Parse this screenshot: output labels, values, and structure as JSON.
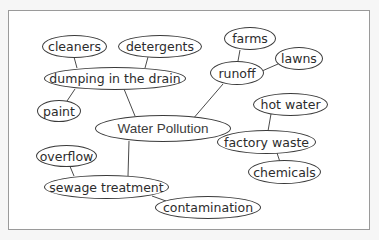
{
  "title": "",
  "diagram": {
    "type": "concept-map",
    "center": "Water Pollution",
    "nodes": {
      "water_pollution": "Water Pollution",
      "dumping": "dumping in the drain",
      "cleaners": "cleaners",
      "detergents": "detergents",
      "paint": "paint",
      "runoff": "runoff",
      "farms": "farms",
      "lawns": "lawns",
      "factory_waste": "factory waste",
      "hot_water": "hot water",
      "chemicals": "chemicals",
      "sewage": "sewage treatment",
      "overflow": "overflow",
      "contamination": "contamination"
    },
    "edges": [
      [
        "Water Pollution",
        "dumping in the drain"
      ],
      [
        "Water Pollution",
        "runoff"
      ],
      [
        "Water Pollution",
        "factory waste"
      ],
      [
        "Water Pollution",
        "sewage treatment"
      ],
      [
        "dumping in the drain",
        "cleaners"
      ],
      [
        "dumping in the drain",
        "detergents"
      ],
      [
        "dumping in the drain",
        "paint"
      ],
      [
        "runoff",
        "farms"
      ],
      [
        "runoff",
        "lawns"
      ],
      [
        "factory waste",
        "hot water"
      ],
      [
        "factory waste",
        "chemicals"
      ],
      [
        "sewage treatment",
        "overflow"
      ],
      [
        "sewage treatment",
        "contamination"
      ]
    ]
  },
  "colors": {
    "line": "#3a3a3a",
    "text": "#2c2c2c",
    "frame": "#9a9a9a",
    "background": "#f6f6f6"
  }
}
